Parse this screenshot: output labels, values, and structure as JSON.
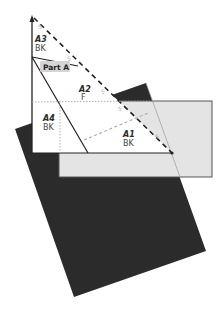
{
  "diagram": {
    "type": "paper-folding-diagram",
    "colors": {
      "background": "#ffffff",
      "dark_sheet": "#2b2b2b",
      "light_sheet": "#e4e4e4",
      "light_sheet_border": "#555555",
      "triangle_fill": "#ffffff",
      "line": "#222222",
      "guide_line": "#b0b0b0",
      "part_label_bg": "#d4d4d4"
    },
    "part_label": "Part A",
    "regions": [
      {
        "id": "A3",
        "sub": "BK"
      },
      {
        "id": "A2",
        "sub": "F"
      },
      {
        "id": "A4",
        "sub": "BK"
      },
      {
        "id": "A1",
        "sub": "BK"
      }
    ],
    "fold_marks": [
      "½",
      "½",
      "½",
      "½"
    ]
  }
}
